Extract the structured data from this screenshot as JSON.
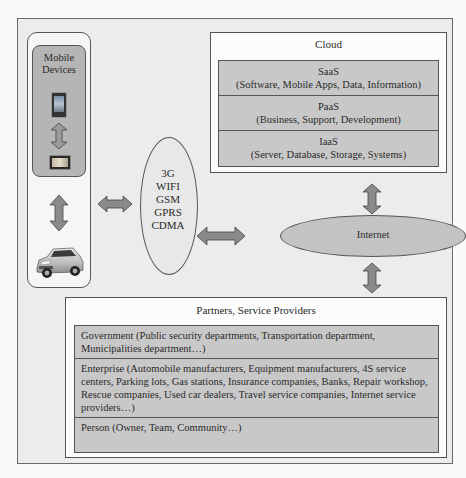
{
  "diagram": {
    "mobile": {
      "title_line1": "Mobile",
      "title_line2": "Devices",
      "devices": [
        "phone",
        "tablet",
        "car"
      ]
    },
    "cloud": {
      "title": "Cloud",
      "layers": [
        {
          "name": "SaaS",
          "detail": "(Software, Mobile Apps, Data, Information)"
        },
        {
          "name": "PaaS",
          "detail": "(Business, Support, Development)"
        },
        {
          "name": "IaaS",
          "detail": "(Server, Database, Storage, Systems)"
        }
      ]
    },
    "networks": {
      "items": [
        "3G",
        "WIFI",
        "GSM",
        "GPRS",
        "CDMA"
      ]
    },
    "internet": {
      "label": "Internet"
    },
    "partners": {
      "title": "Partners, Service Providers",
      "layers": [
        {
          "text": "Government (Public security departments, Transportation department, Municipalities department…)"
        },
        {
          "text": "Enterprise (Automobile manufacturers, Equipment manufacturers, 4S service centers, Parking lots, Gas stations, Insurance companies, Banks, Repair workshop, Rescue companies, Used car dealers, Travel service companies, Internet service providers…)"
        },
        {
          "text": "Person (Owner, Team, Community…)"
        }
      ]
    },
    "colors": {
      "background": "#ececec",
      "box_fill": "#c8c8c8",
      "arrow_fill": "#8a8a8a",
      "stroke": "#555555"
    }
  }
}
